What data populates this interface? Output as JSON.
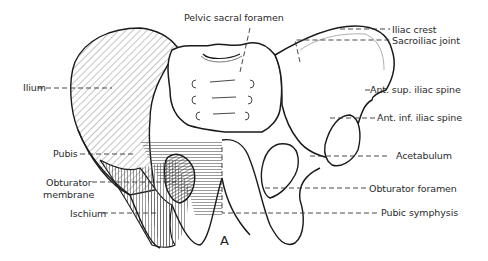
{
  "figure": {
    "panel_label": "A",
    "colors": {
      "outline": "#1a1a1a",
      "hatch": "#555555",
      "leader": "#333333",
      "background": "#ffffff"
    }
  },
  "labels": {
    "pelvic_sacral_foramen": "Pelvic sacral foramen",
    "iliac_crest": "Iliac crest",
    "sacroiliac_joint": "Sacroiliac joint",
    "ant_sup_iliac_spine": "Ant. sup. iliac spine",
    "ant_inf_iliac_spine": "Ant. inf. iliac spine",
    "acetabulum": "Acetabulum",
    "obturator_foramen": "Obturator foramen",
    "pubic_symphysis": "Pubic symphysis",
    "ilium": "Ilium",
    "pubis": "Pubis",
    "obturator_membrane_line1": "Obturator",
    "obturator_membrane_line2": "membrane",
    "ischium": "Ischium"
  }
}
